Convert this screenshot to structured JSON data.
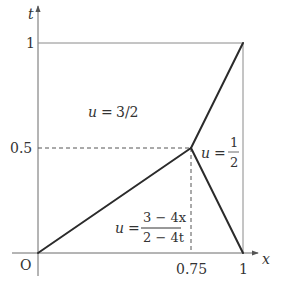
{
  "diagram": {
    "axes": {
      "x_label": "x",
      "y_label": "t",
      "origin_label": "O"
    },
    "ticks": {
      "x": [
        {
          "value": 0.75,
          "label": "0.75"
        },
        {
          "value": 1,
          "label": "1"
        }
      ],
      "y": [
        {
          "value": 0.5,
          "label": "0.5"
        },
        {
          "value": 1,
          "label": "1"
        }
      ]
    },
    "vertex": {
      "x": 0.75,
      "t": 0.5
    },
    "regions": {
      "upper": {
        "lhs": "u",
        "eq": "=",
        "rhs": "3/2"
      },
      "right": {
        "lhs": "u",
        "eq": "=",
        "num": "1",
        "den": "2"
      },
      "lower": {
        "lhs": "u",
        "eq": "=",
        "num": "3 − 4x",
        "den": "2 − 4t"
      }
    },
    "colors": {
      "curve": "#2b2b2b",
      "axis": "#6a6a6a",
      "box": "#8a8a8a",
      "text": "#333333"
    }
  }
}
